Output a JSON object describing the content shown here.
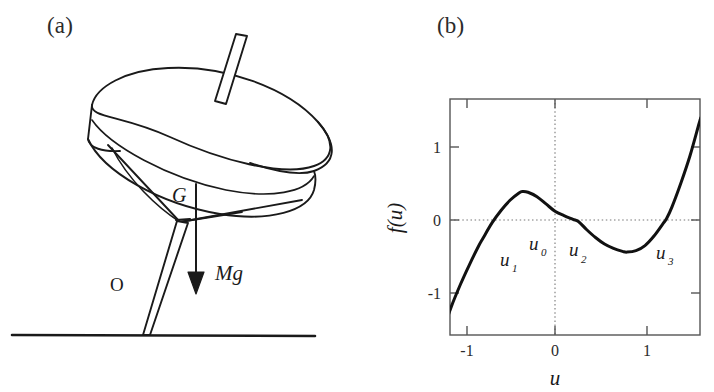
{
  "figure": {
    "panels": [
      {
        "id": "a",
        "label": "(a)"
      },
      {
        "id": "b",
        "label": "(b)"
      }
    ]
  },
  "panel_a": {
    "label": "(a)",
    "description": "spinning-top-schematic",
    "annotations": {
      "center_of_mass": "G",
      "contact_point": "O",
      "weight_force": "Mg"
    },
    "parts": [
      "disk-top-ellipse",
      "disk-rim-side",
      "cone-body",
      "spindle-rod-upper",
      "spike-lower",
      "ground-line",
      "weight-arrow"
    ],
    "colors": {
      "stroke": "#1a1a1a",
      "fill": "#ffffff"
    }
  },
  "panel_b": {
    "label": "(b)",
    "root_labels": [
      {
        "name": "u_1",
        "base": "u",
        "sub": "1",
        "x": 500,
        "y": 262
      },
      {
        "name": "u_0",
        "base": "u",
        "sub": "0",
        "x": 532,
        "y": 250
      },
      {
        "name": "u_2",
        "base": "u",
        "sub": "2",
        "x": 576,
        "y": 254
      },
      {
        "name": "u_3",
        "base": "u",
        "sub": "3",
        "x": 662,
        "y": 257
      }
    ]
  },
  "chart_data": {
    "type": "line",
    "title": "",
    "subtitle": "",
    "xlabel": "u",
    "ylabel": "f(u)",
    "xlim": [
      -1.22,
      1.62
    ],
    "ylim": [
      -1.45,
      1.45
    ],
    "xticks": [
      -1,
      0,
      1
    ],
    "xtick_labels": [
      "-1",
      "0",
      "1"
    ],
    "yticks": [
      -1,
      0,
      1
    ],
    "ytick_labels": [
      "-1",
      "0",
      "1"
    ],
    "grid": false,
    "gridlines": {
      "horizontal_dotted_at_y": 0,
      "vertical_dotted_at_x": 0
    },
    "legend": null,
    "series": [
      {
        "name": "f(u)",
        "color": "#111111",
        "x": [
          -1.22,
          -1.15,
          -1.05,
          -0.95,
          -0.85,
          -0.8,
          -0.7,
          -0.6,
          -0.5,
          -0.4,
          -0.36,
          -0.3,
          -0.2,
          -0.1,
          0.0,
          0.1,
          0.2,
          0.26,
          0.35,
          0.45,
          0.55,
          0.65,
          0.75,
          0.8,
          0.9,
          1.0,
          1.1,
          1.2,
          1.24,
          1.3,
          1.4,
          1.5,
          1.6,
          1.62
        ],
        "y": [
          -1.43,
          -1.18,
          -0.88,
          -0.61,
          -0.36,
          -0.25,
          -0.04,
          0.13,
          0.27,
          0.37,
          0.39,
          0.38,
          0.32,
          0.22,
          0.12,
          0.06,
          0.01,
          -0.02,
          -0.13,
          -0.24,
          -0.33,
          -0.39,
          -0.43,
          -0.44,
          -0.42,
          -0.35,
          -0.22,
          -0.05,
          0.02,
          0.18,
          0.51,
          0.88,
          1.32,
          1.4
        ]
      }
    ],
    "annotations": [
      {
        "text": "u_1",
        "x": -0.6,
        "y": -0.58,
        "note": "label near first root"
      },
      {
        "text": "u_0",
        "x": -0.25,
        "y": -0.42,
        "note": "label left of origin"
      },
      {
        "text": "u_2",
        "x": 0.23,
        "y": -0.47,
        "note": "label near second root"
      },
      {
        "text": "u_3",
        "x": 1.18,
        "y": -0.51,
        "note": "label near third root"
      }
    ],
    "roots_approx": [
      -0.8,
      0.26,
      1.24
    ],
    "local_max": {
      "x": -0.36,
      "y": 0.39
    },
    "local_min": {
      "x": 0.78,
      "y": -0.44
    }
  }
}
